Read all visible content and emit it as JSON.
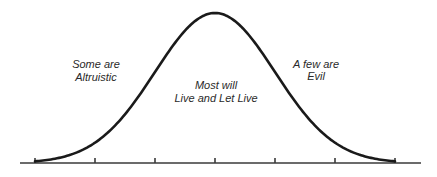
{
  "chart_data": {
    "type": "line",
    "title": "",
    "xlabel": "",
    "ylabel": "",
    "grid": false,
    "distribution": "normal (bell curve)",
    "x_ticks_count": 7,
    "x_tick_labels": [
      "",
      "",
      "",
      "",
      "",
      "",
      ""
    ],
    "x_range_sigma": [
      -3,
      3
    ],
    "mean": 0,
    "std": 1,
    "annotations": [
      {
        "id": "left",
        "lines": [
          "Some are",
          "Altruistic"
        ],
        "region": "left tail"
      },
      {
        "id": "center",
        "lines": [
          "Most will",
          "Live and Let Live"
        ],
        "region": "center"
      },
      {
        "id": "right",
        "lines": [
          "A few are",
          "Evil"
        ],
        "region": "right tail"
      }
    ],
    "colors": {
      "curve": "#1a1a1a",
      "axis": "#3a3a3a",
      "text": "#2a2a2a",
      "background": "#ffffff"
    }
  }
}
